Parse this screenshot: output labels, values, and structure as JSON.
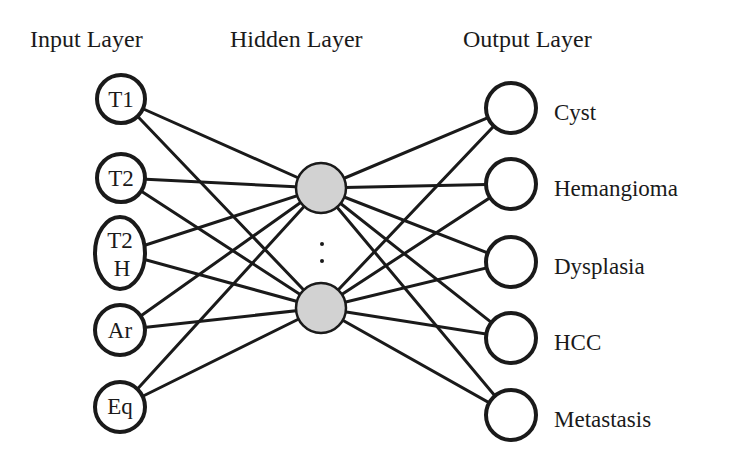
{
  "diagram": {
    "type": "neural-network",
    "colors": {
      "stroke": "#1a1a1a",
      "hidden_fill": "#d2d2d2",
      "io_fill": "#ffffff",
      "background": "#ffffff"
    },
    "layers": {
      "input": {
        "title": "Input Layer",
        "nodes": [
          {
            "id": "T1",
            "lines": [
              "T1"
            ]
          },
          {
            "id": "T2",
            "lines": [
              "T2"
            ]
          },
          {
            "id": "T2H",
            "lines": [
              "T2",
              "H"
            ]
          },
          {
            "id": "Ar",
            "lines": [
              "Ar"
            ]
          },
          {
            "id": "Eq",
            "lines": [
              "Eq"
            ]
          }
        ]
      },
      "hidden": {
        "title": "Hidden Layer",
        "nodes": [
          {
            "id": "h1"
          },
          {
            "id": "hn"
          }
        ],
        "ellipsis": ":"
      },
      "output": {
        "title": "Output Layer",
        "nodes": [
          {
            "id": "Cyst",
            "label": "Cyst"
          },
          {
            "id": "Hemangioma",
            "label": "Hemangioma"
          },
          {
            "id": "Dysplasia",
            "label": "Dysplasia"
          },
          {
            "id": "HCC",
            "label": "HCC"
          },
          {
            "id": "Metastasis",
            "label": "Metastasis"
          }
        ]
      }
    },
    "connectivity": "fully-connected"
  }
}
